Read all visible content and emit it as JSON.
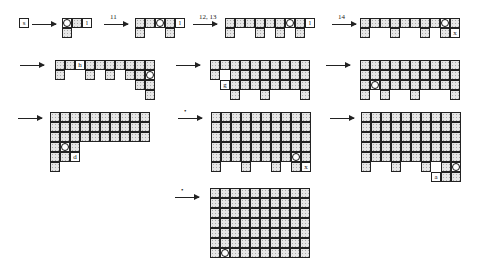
{
  "arrows": [
    {
      "label": "",
      "x": 32,
      "y": 24,
      "w": 24
    },
    {
      "label": "11",
      "x": 104,
      "y": 24,
      "w": 24
    },
    {
      "label": "12, 13",
      "x": 193,
      "y": 24,
      "w": 24
    },
    {
      "label": "14",
      "x": 332,
      "y": 24,
      "w": 24
    },
    {
      "label": "",
      "x": 20,
      "y": 65,
      "w": 24
    },
    {
      "label": "",
      "x": 176,
      "y": 65,
      "w": 24
    },
    {
      "label": "",
      "x": 326,
      "y": 65,
      "w": 24
    },
    {
      "label": "",
      "x": 18,
      "y": 118,
      "w": 24
    },
    {
      "label": "•",
      "x": 178,
      "y": 118,
      "w": 24
    },
    {
      "label": "",
      "x": 330,
      "y": 118,
      "w": 24
    },
    {
      "label": "•",
      "x": 175,
      "y": 197,
      "w": 24
    }
  ],
  "panels": [
    {
      "x": 19,
      "y": 18,
      "cols": 1,
      "rows": 1,
      "missing": [],
      "marks": {
        "0,0": "s"
      },
      "circle": null
    },
    {
      "x": 62,
      "y": 18,
      "cols": 3,
      "rows": 2,
      "missing": [
        "1,1",
        "1,2"
      ],
      "marks": {
        "0,2": "l"
      },
      "circle": "0,0"
    },
    {
      "x": 135,
      "y": 18,
      "cols": 5,
      "rows": 2,
      "missing": [
        "1,1",
        "1,2",
        "1,4"
      ],
      "marks": {
        "0,4": "l"
      },
      "circle": "0,2"
    },
    {
      "x": 225,
      "y": 18,
      "cols": 9,
      "rows": 2,
      "missing": [
        "1,1",
        "1,2",
        "1,4",
        "1,6",
        "1,8"
      ],
      "marks": {
        "0,8": "l"
      },
      "circle": "0,6"
    },
    {
      "x": 360,
      "y": 18,
      "cols": 10,
      "rows": 2,
      "missing": [
        "1,1",
        "1,2",
        "1,4",
        "1,5",
        "1,7"
      ],
      "marks": {
        "1,9": "x"
      },
      "circle": "0,8"
    },
    {
      "x": 55,
      "y": 60,
      "cols": 10,
      "rows": 4,
      "missing": [
        "1,1",
        "1,2",
        "1,4",
        "1,6",
        "2,0",
        "2,1",
        "2,2",
        "2,3",
        "2,4",
        "2,5",
        "2,6",
        "2,7",
        "3,0",
        "3,1",
        "3,2",
        "3,3",
        "3,4",
        "3,5",
        "3,6",
        "3,7",
        "3,8"
      ],
      "marks": {
        "0,2": "h",
        "1,2": "l",
        "2,7": "g"
      },
      "circle": "1,9"
    },
    {
      "x": 210,
      "y": 60,
      "cols": 10,
      "rows": 4,
      "missing": [
        "1,1",
        "3,0",
        "3,1",
        "3,3",
        "3,4",
        "3,6",
        "3,7",
        "3,8",
        "2,0"
      ],
      "marks": {
        "2,1": "g"
      },
      "circle": null
    },
    {
      "x": 360,
      "y": 60,
      "cols": 10,
      "rows": 4,
      "missing": [
        "3,1",
        "3,3",
        "3,4",
        "3,6",
        "3,7",
        "3,8"
      ],
      "marks": {},
      "circle": "2,1"
    },
    {
      "x": 50,
      "y": 112,
      "cols": 10,
      "rows": 6,
      "missing": [
        "3,3",
        "3,5",
        "3,6",
        "3,8",
        "3,9",
        "4,3",
        "4,4",
        "4,5",
        "4,6",
        "4,7",
        "4,8",
        "4,9",
        "5,1",
        "5,2",
        "5,3",
        "5,4",
        "5,5",
        "5,6",
        "5,7",
        "5,8",
        "5,9",
        "3,4",
        "3,7"
      ],
      "marks": {
        "4,2": "d"
      },
      "circle": "3,1"
    },
    {
      "x": 211,
      "y": 112,
      "cols": 10,
      "rows": 6,
      "missing": [
        "5,1",
        "5,2",
        "5,4",
        "5,5",
        "5,7"
      ],
      "marks": {
        "5,9": "x"
      },
      "circle": "4,8"
    },
    {
      "x": 361,
      "y": 112,
      "cols": 10,
      "rows": 7,
      "missing": [
        "5,1",
        "5,2",
        "5,4",
        "5,5",
        "5,7",
        "6,0",
        "6,1",
        "6,2",
        "6,3",
        "6,4",
        "6,5",
        "6,6"
      ],
      "marks": {
        "6,7": "a"
      },
      "circle": "5,9"
    },
    {
      "x": 210,
      "y": 188,
      "cols": 10,
      "rows": 7,
      "missing": [],
      "marks": {},
      "circle": "6,1"
    }
  ]
}
